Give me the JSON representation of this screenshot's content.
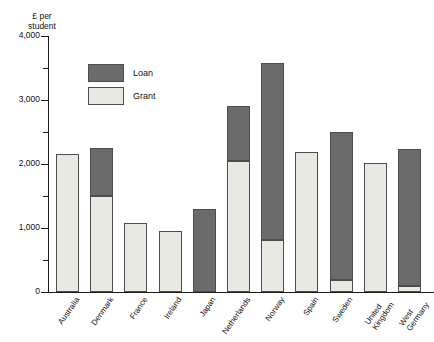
{
  "chart_data": {
    "type": "bar",
    "subtype": "stacked-vertical",
    "title": "",
    "subtitle": "",
    "xlabel": "",
    "ylabel": "£ per\nstudent",
    "ylabel_lines": [
      "£ per",
      "student"
    ],
    "ylim": [
      0,
      4000
    ],
    "ytick_values": [
      0,
      1000,
      2000,
      3000,
      4000
    ],
    "ytick_labels": [
      "0",
      "1,000",
      "2,000",
      "3,000",
      "4,000"
    ],
    "yminor_values": [
      500,
      1500,
      2500,
      3500
    ],
    "grid": false,
    "legend_position": "inside-top-left",
    "currency": "£",
    "unit": "£ per student",
    "categories": [
      "Australia",
      "Denmark",
      "France",
      "Ireland",
      "Japan",
      "Netherlands",
      "Norway",
      "Spain",
      "Sweden",
      "United Kingdom",
      "West Germany"
    ],
    "category_label_lines": [
      [
        "Australia"
      ],
      [
        "Denmark"
      ],
      [
        "France"
      ],
      [
        "Ireland"
      ],
      [
        "Japan"
      ],
      [
        "Netherlands"
      ],
      [
        "Norway"
      ],
      [
        "Spain"
      ],
      [
        "Sweden"
      ],
      [
        "United",
        "Kingdom"
      ],
      [
        "West",
        "Germany"
      ]
    ],
    "series": [
      {
        "name": "Grant",
        "color": "#e9e9e4",
        "values": [
          2150,
          1500,
          1080,
          960,
          0,
          2050,
          810,
          2180,
          180,
          2020,
          90
        ]
      },
      {
        "name": "Loan",
        "color": "#6b6b6b",
        "values": [
          0,
          750,
          0,
          0,
          1300,
          850,
          2770,
          0,
          2320,
          0,
          2140
        ]
      }
    ],
    "totals": [
      2150,
      2250,
      1080,
      960,
      1300,
      2900,
      3580,
      2180,
      2500,
      2020,
      2230
    ],
    "stack_order": [
      "Grant",
      "Loan"
    ],
    "annotations": []
  },
  "legend": {
    "items": [
      {
        "label": "Loan",
        "key": "loan"
      },
      {
        "label": "Grant",
        "key": "grant"
      }
    ]
  },
  "colors": {
    "loan": "#6b6b6b",
    "grant": "#e9e9e4",
    "axis": "#1a1a1a",
    "bar_border": "#4d4d4d",
    "background": "#ffffff",
    "text": "#111111"
  }
}
